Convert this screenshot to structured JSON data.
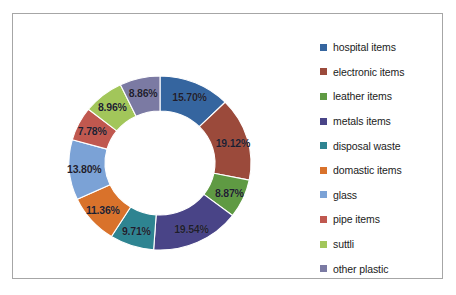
{
  "chart_data": {
    "type": "pie",
    "variant": "donut",
    "title": "",
    "xlabel": "",
    "ylabel": "",
    "grid": false,
    "legend_position": "right",
    "units": "percent",
    "labels": [
      "hospital items",
      "electronic items",
      "leather items",
      "metals items",
      "disposal waste",
      "domastic items",
      "glass",
      "pipe items",
      "suttli",
      "other plastic"
    ],
    "values": [
      15.7,
      19.12,
      8.87,
      19.54,
      9.71,
      11.36,
      13.8,
      7.78,
      8.96,
      8.86
    ],
    "data_labels": [
      "15.70%",
      "19.12%",
      "8.87%",
      "19.54%",
      "9.71%",
      "11.36%",
      "13.80%",
      "7.78%",
      "8.96%",
      "8.86%"
    ],
    "colors": [
      "#35659f",
      "#9b4a3b",
      "#5f9a43",
      "#494487",
      "#2e8491",
      "#d9722b",
      "#7ba2d6",
      "#c0584f",
      "#a2c65a",
      "#7b7aa3"
    ]
  },
  "legend": {
    "items": [
      {
        "label": "hospital items",
        "color": "#35659f"
      },
      {
        "label": "electronic items",
        "color": "#9b4a3b"
      },
      {
        "label": "leather items",
        "color": "#5f9a43"
      },
      {
        "label": "metals items",
        "color": "#494487"
      },
      {
        "label": "disposal waste",
        "color": "#2e8491"
      },
      {
        "label": "domastic items",
        "color": "#d9722b"
      },
      {
        "label": "glass",
        "color": "#7ba2d6"
      },
      {
        "label": "pipe items",
        "color": "#c0584f"
      },
      {
        "label": "suttli",
        "color": "#a2c65a"
      },
      {
        "label": "other plastic",
        "color": "#7b7aa3"
      }
    ]
  },
  "frame": {
    "border_color": "#a6a6a6",
    "background": "#ffffff"
  }
}
